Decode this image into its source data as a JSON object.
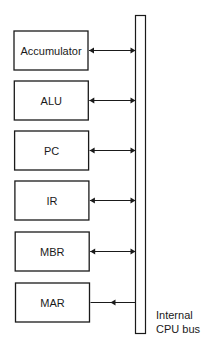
{
  "diagram": {
    "registers": [
      {
        "label": "Accumulator",
        "connection": "bidirectional"
      },
      {
        "label": "ALU",
        "connection": "bidirectional"
      },
      {
        "label": "PC",
        "connection": "bidirectional"
      },
      {
        "label": "IR",
        "connection": "bidirectional"
      },
      {
        "label": "MBR",
        "connection": "bidirectional"
      },
      {
        "label": "MAR",
        "connection": "from-bus"
      }
    ],
    "bus": {
      "label_line1": "Internal",
      "label_line2": "CPU bus"
    }
  }
}
